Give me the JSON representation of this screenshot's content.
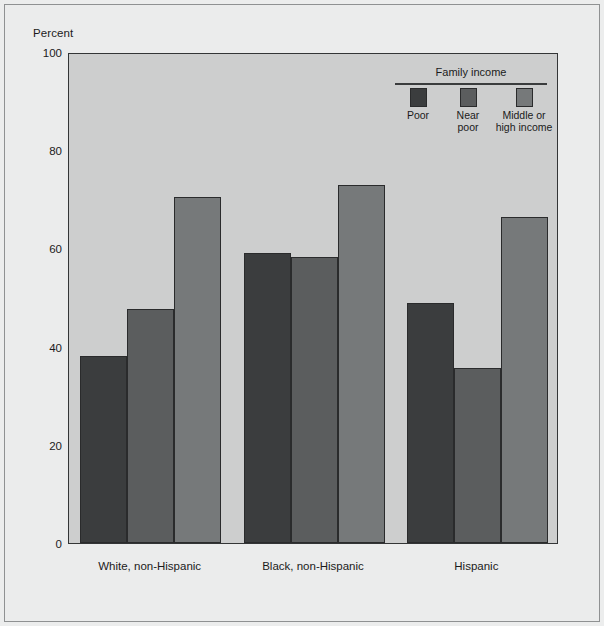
{
  "chart_data": {
    "type": "bar",
    "title": "",
    "subtitle": "",
    "xlabel": "",
    "ylabel": "Percent",
    "ylim": [
      0,
      100
    ],
    "yticks": [
      0,
      20,
      40,
      60,
      80,
      100
    ],
    "ytick_labels": [
      "0",
      "20",
      "40",
      "60",
      "80",
      "100"
    ],
    "grid": false,
    "legend_position": "top-right",
    "legend_title": "Family income",
    "categories": [
      "White, non-Hispanic",
      "Black, non-Hispanic",
      "Hispanic"
    ],
    "series": [
      {
        "name": "Poor",
        "color": "#3b3d3e",
        "values": [
          38.0,
          59.0,
          48.8
        ]
      },
      {
        "name": "Near poor",
        "color": "#5b5d5e",
        "values": [
          47.6,
          58.3,
          35.6
        ]
      },
      {
        "name": "Middle or high income",
        "color": "#76797a",
        "values": [
          70.5,
          73.0,
          66.3
        ]
      }
    ]
  },
  "axis": {
    "y_caption": "Percent"
  },
  "legend": {
    "title": "Family income",
    "entries": [
      {
        "label": "Poor",
        "color": "#3b3d3e"
      },
      {
        "label": "Near\npoor",
        "color": "#5b5d5e"
      },
      {
        "label": "Middle or\nhigh income",
        "color": "#76797a"
      }
    ]
  },
  "colors": {
    "page_background": "#ebecec",
    "plot_background": "#cdcece",
    "axis_line": "#333536",
    "text": "#1b1b1b"
  }
}
